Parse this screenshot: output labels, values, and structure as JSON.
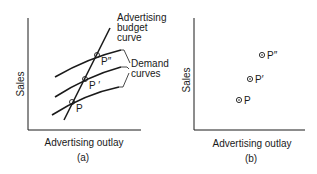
{
  "panel_a": {
    "y_axis_label": "Sales",
    "x_axis_label": "Advertising outlay",
    "caption": "(a)",
    "budget_curve_label": [
      "Advertising",
      "budget",
      "curve"
    ],
    "demand_curves_label": [
      "Demand",
      "curves"
    ],
    "points": [
      {
        "label": "P",
        "x": 72,
        "y": 102
      },
      {
        "label": "P ′",
        "x": 85,
        "y": 79
      },
      {
        "label": "P″",
        "x": 97,
        "y": 55
      }
    ]
  },
  "panel_b": {
    "y_axis_label": "Sales",
    "x_axis_label": "Advertising outlay",
    "caption": "(b)",
    "points": [
      {
        "label": "P",
        "x": 239,
        "y": 100
      },
      {
        "label": "P′",
        "x": 250,
        "y": 79
      },
      {
        "label": "P″",
        "x": 262,
        "y": 55
      }
    ]
  },
  "colors": {
    "ink": "#1a1a1a",
    "background": "#ffffff"
  }
}
